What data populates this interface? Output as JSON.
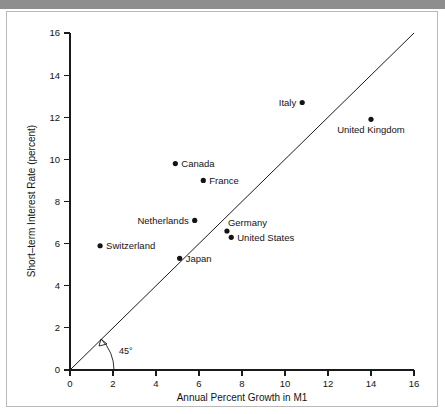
{
  "chart_data": {
    "type": "scatter",
    "title": "",
    "xlabel": "Annual Percent Growth in M1",
    "ylabel": "Short–term Interest Rate (percent)",
    "xlim": [
      0,
      16
    ],
    "ylim": [
      0,
      16
    ],
    "xticks": [
      "0",
      "2",
      "4",
      "6",
      "8",
      "10",
      "12",
      "14",
      "16"
    ],
    "yticks": [
      "0",
      "2",
      "4",
      "6",
      "8",
      "10",
      "12",
      "14",
      "16"
    ],
    "grid": false,
    "legend": "none",
    "annotations": [
      {
        "text": "45°",
        "meaning": "angle-of-reference-line"
      }
    ],
    "reference_line": {
      "description": "45-degree line through origin",
      "from": [
        0,
        0
      ],
      "to": [
        16,
        16
      ]
    },
    "points": [
      {
        "label": "Italy",
        "x": 10.8,
        "y": 12.7,
        "label_pos": "left"
      },
      {
        "label": "United Kingdom",
        "x": 14.0,
        "y": 11.9,
        "label_pos": "below"
      },
      {
        "label": "Canada",
        "x": 4.9,
        "y": 9.8,
        "label_pos": "right"
      },
      {
        "label": "France",
        "x": 6.2,
        "y": 9.0,
        "label_pos": "right"
      },
      {
        "label": "Netherlands",
        "x": 5.8,
        "y": 7.1,
        "label_pos": "left"
      },
      {
        "label": "Germany",
        "x": 7.3,
        "y": 6.6,
        "label_pos": "above-right"
      },
      {
        "label": "United States",
        "x": 7.5,
        "y": 6.3,
        "label_pos": "right"
      },
      {
        "label": "Switzerland",
        "x": 1.4,
        "y": 5.9,
        "label_pos": "right"
      },
      {
        "label": "Japan",
        "x": 5.1,
        "y": 5.3,
        "label_pos": "right"
      }
    ]
  },
  "colors": {
    "ink": "#141414",
    "axis": "#1a1a1a",
    "frame": "#b9b9b9",
    "top_band": "#8e8e8e",
    "background": "#ffffff"
  }
}
